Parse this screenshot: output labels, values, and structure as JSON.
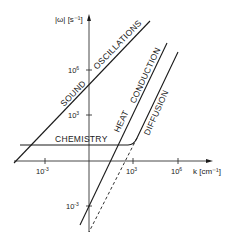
{
  "diagram": {
    "type": "dispersion-relation log-log sketch",
    "y_axis": {
      "label": "|ω| [s⁻¹]",
      "ticks": [
        {
          "base": "10",
          "exp": "6"
        },
        {
          "base": "10",
          "exp": "3"
        },
        {
          "base": "10",
          "exp": "-3"
        }
      ]
    },
    "x_axis": {
      "label": "k [cm⁻¹]",
      "ticks": [
        {
          "base": "10",
          "exp": "-3"
        },
        {
          "base": "10",
          "exp": "3"
        },
        {
          "base": "10",
          "exp": "6"
        }
      ]
    },
    "curves": {
      "sound": "SOUND",
      "oscillations": "OSCILLATIONS",
      "heat": "HEAT",
      "conduction": "CONDUCTION",
      "diffusion": "DIFFUSION",
      "chemistry": "CHEMISTRY"
    }
  }
}
